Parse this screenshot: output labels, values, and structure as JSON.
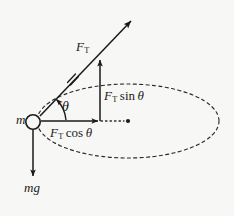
{
  "figure": {
    "background_color": "#f7f7f6",
    "ink_color": "#1a1a1a",
    "labels": {
      "mass": {
        "symbol": "m"
      },
      "tension": {
        "symbol": "F",
        "subscript": "T"
      },
      "angle": {
        "symbol": "θ"
      },
      "horizontal_component": {
        "symbol": "F",
        "subscript": "T",
        "operator": "cos",
        "angle": "θ"
      },
      "vertical_component": {
        "symbol": "F",
        "subscript": "T",
        "operator": "sin",
        "angle": "θ"
      },
      "weight": {
        "symbol": "mg"
      }
    },
    "geometry": {
      "pivot_mass_center": {
        "x": 33,
        "y": 122,
        "r": 7
      },
      "tension_arrow": {
        "x1": 40,
        "y1": 116,
        "x2": 133,
        "y2": 19
      },
      "tension_tick_mark": {
        "x": 72,
        "y": 78,
        "count": 2
      },
      "horizontal_arrow": {
        "x1": 41,
        "y1": 121,
        "x2": 100,
        "y2": 121
      },
      "vertical_arrow": {
        "x1": 100,
        "y1": 121,
        "x2": 100,
        "y2": 58
      },
      "weight_arrow": {
        "x1": 33,
        "y1": 130,
        "x2": 33,
        "y2": 178
      },
      "angle_arc": {
        "cx": 33,
        "cy": 121,
        "r": 33,
        "start_deg": 0,
        "end_deg": 46
      },
      "orbit_ellipse": {
        "cx": 128,
        "cy": 121,
        "rx": 91,
        "ry": 37,
        "style": "dashed"
      },
      "orbit_center_dot": {
        "x": 128,
        "y": 121,
        "r": 2
      },
      "dotted_radius": {
        "x1": 101,
        "y1": 121,
        "x2": 126,
        "y2": 121
      }
    }
  }
}
